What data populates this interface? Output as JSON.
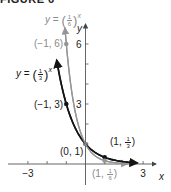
{
  "figure_caption": "FIGURE 6",
  "colors": {
    "curve_third": "#141414",
    "curve_sixth": "#959595",
    "axis": "#555555",
    "label_gray": "#8a8a8a"
  },
  "axes": {
    "x_label": "x",
    "y_label": "y",
    "x_ticks": [
      {
        "value": -3,
        "label": "−3"
      },
      {
        "value": -2,
        "label": ""
      },
      {
        "value": -1,
        "label": ""
      },
      {
        "value": 1,
        "label": ""
      },
      {
        "value": 2,
        "label": ""
      },
      {
        "value": 3,
        "label": "3"
      }
    ],
    "y_ticks": [
      {
        "value": 1,
        "label": ""
      },
      {
        "value": 2,
        "label": ""
      },
      {
        "value": 3,
        "label": "3"
      },
      {
        "value": 4,
        "label": ""
      },
      {
        "value": 5,
        "label": ""
      },
      {
        "value": 6,
        "label": "6"
      }
    ]
  },
  "labels": {
    "curve_sixth": {
      "y": "y",
      "eq": "=",
      "num": "1",
      "den": "6",
      "exp": "x"
    },
    "curve_third": {
      "y": "y",
      "eq": "=",
      "num": "1",
      "den": "3",
      "exp": "x"
    },
    "pt_m1_6": "(−1, 6)",
    "pt_m1_3": "(−1, 3)",
    "pt_0_1": "(0, 1)",
    "pt_1_third": {
      "prefix": "(1,",
      "num": "1",
      "den": "3",
      "suffix": ")"
    },
    "pt_1_sixth": {
      "prefix": "(1,",
      "num": "1",
      "den": "6",
      "suffix": ")"
    }
  },
  "chart_data": {
    "type": "line",
    "title": "",
    "xlabel": "x",
    "ylabel": "y",
    "xlim": [
      -4,
      3.5
    ],
    "ylim": [
      -1.5,
      7
    ],
    "grid": false,
    "series": [
      {
        "name": "y = (1/3)^x",
        "color": "#141414",
        "function": "(1/3)^x",
        "x_range": [
          -1.5,
          2.7
        ],
        "points": [
          {
            "x": -1,
            "y": 3,
            "label": "(−1, 3)"
          },
          {
            "x": 0,
            "y": 1,
            "label": "(0, 1)"
          },
          {
            "x": 1,
            "y": 0.3333,
            "label": "(1, 1/3)"
          }
        ]
      },
      {
        "name": "y = (1/6)^x",
        "color": "#959595",
        "function": "(1/6)^x",
        "x_range": [
          -1.07,
          2.2
        ],
        "points": [
          {
            "x": -1,
            "y": 6,
            "label": "(−1, 6)"
          },
          {
            "x": 0,
            "y": 1,
            "label": "(0, 1)"
          },
          {
            "x": 1,
            "y": 0.1667,
            "label": "(1, 1/6)"
          }
        ]
      }
    ],
    "annotations": [
      "y = (1/6)^x",
      "y = (1/3)^x",
      "(−1, 6)",
      "(−1, 3)",
      "(0, 1)",
      "(1, 1/3)",
      "(1, 1/6)"
    ]
  }
}
